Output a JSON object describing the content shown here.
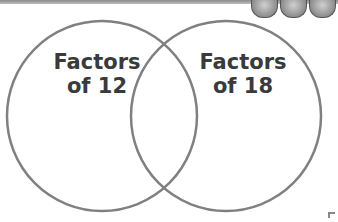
{
  "diagram": {
    "type": "venn",
    "sets": [
      {
        "label_line1": "Factors",
        "label_line2": "of 12"
      },
      {
        "label_line1": "Factors",
        "label_line2": "of 18"
      }
    ],
    "stroke_color": "#808080",
    "text_color": "#3a3a3a"
  },
  "decorations": {
    "header_dots": 3
  }
}
